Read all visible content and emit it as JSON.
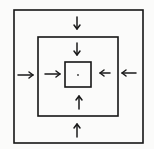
{
  "diagram": {
    "colors": {
      "paper": "#fbfbfa",
      "ink": "#161616"
    },
    "squares": [
      {
        "id": "outer",
        "x1": 14,
        "y1": 10,
        "x2": 143,
        "y2": 143
      },
      {
        "id": "middle",
        "x1": 38,
        "y1": 37,
        "x2": 118,
        "y2": 116
      },
      {
        "id": "inner",
        "x1": 65,
        "y1": 62,
        "x2": 91,
        "y2": 87
      }
    ],
    "center_dot": {
      "x": 78,
      "y": 75
    },
    "arrows": [
      {
        "id": "outer-top",
        "direction": "down",
        "x1": 77,
        "y1": 17,
        "x2": 77,
        "y2": 29
      },
      {
        "id": "middle-top",
        "direction": "down",
        "x1": 77,
        "y1": 43,
        "x2": 77,
        "y2": 55
      },
      {
        "id": "outer-left",
        "direction": "right",
        "x1": 18,
        "y1": 75,
        "x2": 33,
        "y2": 75
      },
      {
        "id": "middle-left",
        "direction": "right",
        "x1": 45,
        "y1": 74,
        "x2": 60,
        "y2": 74
      },
      {
        "id": "middle-right",
        "direction": "left",
        "x1": 110,
        "y1": 73,
        "x2": 100,
        "y2": 73
      },
      {
        "id": "outer-right",
        "direction": "left",
        "x1": 136,
        "y1": 73,
        "x2": 122,
        "y2": 73
      },
      {
        "id": "middle-bottom",
        "direction": "up",
        "x1": 79,
        "y1": 109,
        "x2": 79,
        "y2": 96
      },
      {
        "id": "outer-bottom",
        "direction": "up",
        "x1": 77,
        "y1": 137,
        "x2": 77,
        "y2": 124
      }
    ]
  }
}
